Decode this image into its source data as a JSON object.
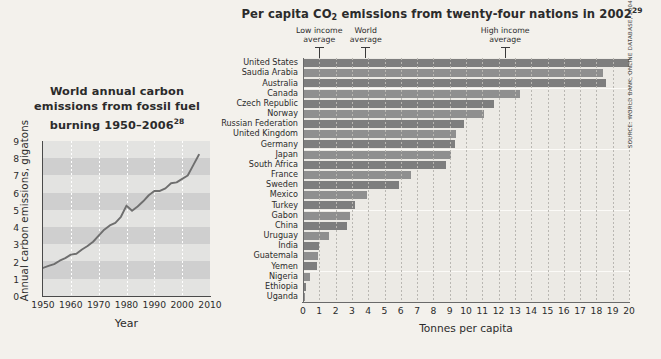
{
  "source_note": "SOURCE: WORLD BANK, ONLINE DATABASE, 2004.",
  "line_chart": {
    "title_line1": "World annual carbon",
    "title_line2": "emissions from fossil fuel",
    "title_line3": "burning 1950–2006",
    "title_footnote": "28",
    "ylabel": "Annual carbon emissions, gigatons",
    "xlabel": "Year"
  },
  "bar_chart": {
    "title_part1": "Per capita CO",
    "title_sub": "2",
    "title_part2": " emissions from  twenty-four nations in 2002",
    "title_footnote": "29",
    "xlabel": "Tonnes per capita",
    "markers": [
      {
        "name": "low-income-average",
        "label_line1": "Low income",
        "label_line2": "average",
        "value": 1.0
      },
      {
        "name": "world-average",
        "label_line1": "World",
        "label_line2": "average",
        "value": 3.85
      },
      {
        "name": "high-income-average",
        "label_line1": "High income",
        "label_line2": "average",
        "value": 12.4
      }
    ]
  },
  "chart_data": [
    {
      "type": "line",
      "title": "World annual carbon emissions from fossil fuel burning 1950–2006",
      "xlabel": "Year",
      "ylabel": "Annual carbon emissions, gigatons",
      "xlim": [
        1950,
        2010
      ],
      "ylim": [
        0,
        9
      ],
      "xticks": [
        1950,
        1960,
        1970,
        1980,
        1990,
        2000,
        2010
      ],
      "yticks": [
        0,
        1,
        2,
        3,
        4,
        5,
        6,
        7,
        8,
        9
      ],
      "grid": true,
      "legend": null,
      "x": [
        1950,
        1952,
        1954,
        1956,
        1958,
        1960,
        1962,
        1964,
        1966,
        1968,
        1970,
        1972,
        1974,
        1976,
        1978,
        1980,
        1982,
        1984,
        1986,
        1988,
        1990,
        1992,
        1994,
        1996,
        1998,
        2000,
        2002,
        2004,
        2006
      ],
      "values": [
        1.63,
        1.75,
        1.85,
        2.05,
        2.2,
        2.4,
        2.45,
        2.7,
        2.9,
        3.15,
        3.5,
        3.85,
        4.1,
        4.25,
        4.6,
        5.25,
        4.95,
        5.2,
        5.5,
        5.85,
        6.1,
        6.1,
        6.25,
        6.55,
        6.6,
        6.8,
        7.0,
        7.6,
        8.2
      ]
    },
    {
      "type": "bar",
      "orientation": "horizontal",
      "title": "Per capita CO2 emissions from twenty-four nations in 2002",
      "xlabel": "Tonnes per capita",
      "ylabel": "",
      "xlim": [
        0,
        20
      ],
      "xticks": [
        0,
        1,
        2,
        3,
        4,
        5,
        6,
        7,
        8,
        9,
        10,
        11,
        12,
        13,
        14,
        15,
        16,
        17,
        18,
        19,
        20
      ],
      "grid": true,
      "categories": [
        "United States",
        "Saudia Arabia",
        "Australia",
        "Canada",
        "Czech Republic",
        "Norway",
        "Russian Federation",
        "United Kingdom",
        "Germany",
        "Japan",
        "South Africa",
        "France",
        "Sweden",
        "Mexico",
        "Turkey",
        "Gabon",
        "China",
        "Uruguay",
        "India",
        "Guatemala",
        "Yemen",
        "Nigeria",
        "Ethiopia",
        "Uganda"
      ],
      "values": [
        20.0,
        18.4,
        18.6,
        13.3,
        11.7,
        11.1,
        9.9,
        9.4,
        9.3,
        9.1,
        8.8,
        6.6,
        5.9,
        3.9,
        3.2,
        2.9,
        2.7,
        1.6,
        1.0,
        0.9,
        0.85,
        0.4,
        0.2,
        0.1
      ],
      "annotations": [
        {
          "label": "Low income average",
          "value": 1.0
        },
        {
          "label": "World average",
          "value": 3.85
        },
        {
          "label": "High income average",
          "value": 12.4
        }
      ]
    }
  ]
}
